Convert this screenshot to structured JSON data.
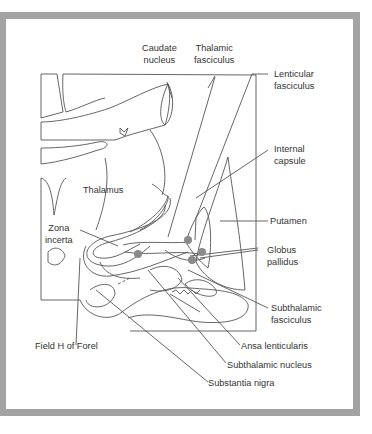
{
  "figure": {
    "labels": {
      "caudate_nucleus": "Caudate\nnucleus",
      "thalamic_fasciculus": "Thalamic\nfasciculus",
      "lenticular_fasciculus": "Lenticular\nfasciculus",
      "internal_capsule": "Internal\ncapsule",
      "thalamus": "Thalamus",
      "putamen": "Putamen",
      "zona_incerta": "Zona\nincerta",
      "globus_pallidus": "Globus\npallidus",
      "subthalamic_fasciculus": "Subthalamic\nfasciculus",
      "field_h_of_forel": "Field H of Forel",
      "ansa_lenticularis": "Ansa lenticularis",
      "subthalamic_nucleus": "Subthalamic nucleus",
      "substantia_nigra": "Substantia nigra"
    },
    "colors": {
      "frame": "#a3a3a3",
      "line": "#555555",
      "dot": "#8a8a8a"
    }
  }
}
